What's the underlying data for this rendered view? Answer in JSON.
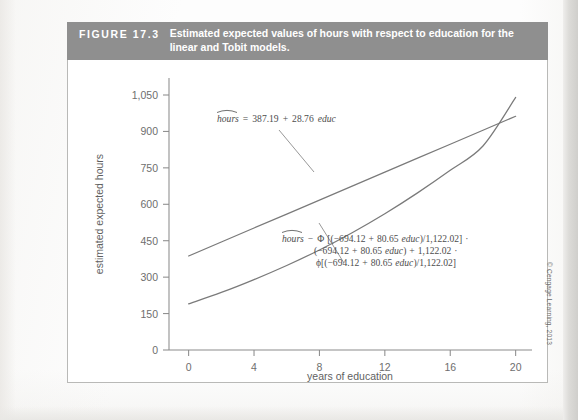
{
  "figure": {
    "number_label": "FIGURE  17.3",
    "caption": "Estimated expected values of hours with respect to education for the linear and Tobit models."
  },
  "credit": "© Cengage Learning, 2013",
  "chart_data": {
    "type": "line",
    "title": "Estimated expected values of hours with respect to education for the linear and Tobit models.",
    "xlabel": "years of education",
    "ylabel": "estimated expected  hours",
    "xlim": [
      -1.2,
      21.0
    ],
    "ylim": [
      0,
      1120
    ],
    "xticks": [
      0,
      4,
      8,
      12,
      16,
      20
    ],
    "xticklabels": [
      "0",
      "4",
      "8",
      "12",
      "16",
      "20"
    ],
    "yticks": [
      0,
      150,
      300,
      450,
      600,
      750,
      900,
      1050
    ],
    "yticklabels": [
      "0",
      "150",
      "300",
      "450",
      "600",
      "750",
      "900",
      "1,050"
    ],
    "grid": false,
    "legend": "none",
    "series": [
      {
        "name": "linear",
        "equation_text": "hours = 387.19 + 28.76 educ",
        "x": [
          0,
          2,
          4,
          6,
          8,
          10,
          12,
          14,
          16,
          18,
          20
        ],
        "values": [
          387.19,
          444.71,
          502.23,
          559.75,
          617.27,
          674.79,
          732.31,
          789.83,
          847.35,
          904.87,
          962.39
        ]
      },
      {
        "name": "tobit",
        "equation_text": "hours = Φ [(−694.12 + 80.65 educ)/1,122.02] · (−694.12 + 80.65 educ) + 1,122.02 · φ[(−694.12 + 80.65 educ)/1,122.02]",
        "x": [
          0,
          2,
          4,
          6,
          8,
          10,
          12,
          14,
          16,
          18,
          20
        ],
        "values": [
          190,
          237,
          290,
          348,
          412,
          483,
          561,
          647,
          740,
          840,
          1040
        ]
      }
    ],
    "annotations": [
      {
        "id": "linear-equation",
        "lines": [
          "hours = 387.19 + 28.76 educ"
        ]
      },
      {
        "id": "tobit-equation",
        "lines": [
          "hours − Φ [(−694.12 + 80.65 educ)/1,122.02] ·",
          "(−694.12 + 80.65 educ) + 1,122.02 ·",
          "φ[(−694.12 + 80.65 educ)/1,122.02]"
        ]
      }
    ]
  },
  "colors": {
    "header_bar": "#8f8f8f",
    "line": "#7a7a7a",
    "axis": "#8c8c8c",
    "tick_text": "#6e6e6e"
  }
}
